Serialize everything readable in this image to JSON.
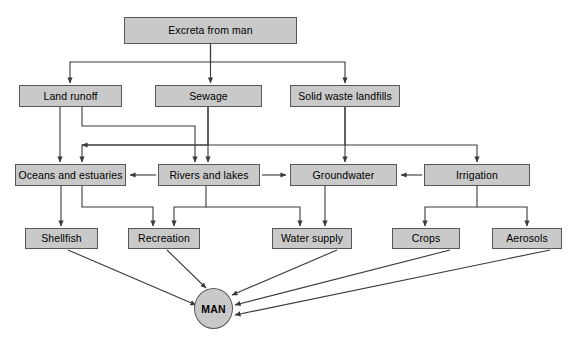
{
  "diagram": {
    "colors": {
      "node_fill": "#c9c9c9",
      "node_border": "#575757",
      "edge": "#3a3a3a",
      "background": "#ffffff",
      "text": "#000000"
    },
    "nodes": [
      {
        "id": "excreta",
        "label": "Excreta from man",
        "x": 124,
        "y": 17,
        "w": 173,
        "h": 27,
        "shape": "rect"
      },
      {
        "id": "landrunoff",
        "label": "Land runoff",
        "x": 19,
        "y": 85,
        "w": 103,
        "h": 22,
        "shape": "rect"
      },
      {
        "id": "sewage",
        "label": "Sewage",
        "x": 155,
        "y": 85,
        "w": 107,
        "h": 22,
        "shape": "rect"
      },
      {
        "id": "landfills",
        "label": "Solid waste landfills",
        "x": 290,
        "y": 85,
        "w": 110,
        "h": 22,
        "shape": "rect"
      },
      {
        "id": "oceans",
        "label": "Oceans and estuaries",
        "x": 15,
        "y": 164,
        "w": 111,
        "h": 22,
        "shape": "rect"
      },
      {
        "id": "rivers",
        "label": "Rivers and lakes",
        "x": 158,
        "y": 164,
        "w": 102,
        "h": 22,
        "shape": "rect"
      },
      {
        "id": "groundwater",
        "label": "Groundwater",
        "x": 290,
        "y": 164,
        "w": 107,
        "h": 22,
        "shape": "rect"
      },
      {
        "id": "irrigation",
        "label": "Irrigation",
        "x": 424,
        "y": 164,
        "w": 106,
        "h": 22,
        "shape": "rect"
      },
      {
        "id": "shellfish",
        "label": "Shellfish",
        "x": 25,
        "y": 228,
        "w": 73,
        "h": 21,
        "shape": "rect"
      },
      {
        "id": "recreation",
        "label": "Recreation",
        "x": 128,
        "y": 228,
        "w": 72,
        "h": 21,
        "shape": "rect"
      },
      {
        "id": "watersupply",
        "label": "Water supply",
        "x": 272,
        "y": 228,
        "w": 80,
        "h": 21,
        "shape": "rect"
      },
      {
        "id": "crops",
        "label": "Crops",
        "x": 392,
        "y": 228,
        "w": 68,
        "h": 21,
        "shape": "rect"
      },
      {
        "id": "aerosols",
        "label": "Aerosols",
        "x": 492,
        "y": 228,
        "w": 70,
        "h": 21,
        "shape": "rect"
      },
      {
        "id": "man",
        "label": "MAN",
        "x": 194,
        "y": 288,
        "w": 39,
        "h": 41,
        "shape": "ellipse"
      }
    ],
    "edges": [
      {
        "from": "excreta",
        "to": "landrunoff"
      },
      {
        "from": "excreta",
        "to": "sewage"
      },
      {
        "from": "excreta",
        "to": "landfills"
      },
      {
        "from": "landrunoff",
        "to": "oceans"
      },
      {
        "from": "landrunoff",
        "to": "rivers"
      },
      {
        "from": "sewage",
        "to": "oceans"
      },
      {
        "from": "sewage",
        "to": "rivers"
      },
      {
        "from": "landfills",
        "to": "groundwater"
      },
      {
        "from": "landfills",
        "to": "oceans"
      },
      {
        "from": "landfills",
        "to": "irrigation"
      },
      {
        "from": "rivers",
        "to": "oceans"
      },
      {
        "from": "rivers",
        "to": "groundwater"
      },
      {
        "from": "irrigation",
        "to": "groundwater"
      },
      {
        "from": "oceans",
        "to": "shellfish"
      },
      {
        "from": "oceans",
        "to": "recreation"
      },
      {
        "from": "rivers",
        "to": "recreation"
      },
      {
        "from": "rivers",
        "to": "watersupply"
      },
      {
        "from": "groundwater",
        "to": "watersupply"
      },
      {
        "from": "irrigation",
        "to": "crops"
      },
      {
        "from": "irrigation",
        "to": "aerosols"
      },
      {
        "from": "shellfish",
        "to": "man"
      },
      {
        "from": "recreation",
        "to": "man"
      },
      {
        "from": "watersupply",
        "to": "man"
      },
      {
        "from": "crops",
        "to": "man"
      },
      {
        "from": "aerosols",
        "to": "man"
      }
    ]
  }
}
